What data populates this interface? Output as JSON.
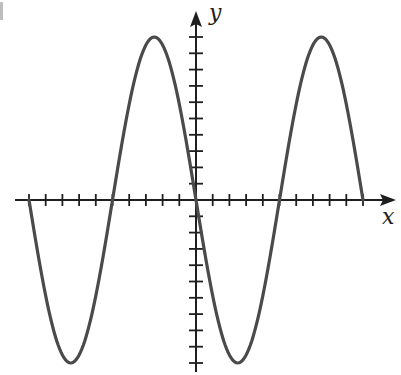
{
  "chart_data": {
    "type": "line",
    "title": "",
    "xlabel": "x",
    "ylabel": "y",
    "xlim": [
      -10,
      11.8
    ],
    "ylim": [
      -10.5,
      11.5
    ],
    "grid": false,
    "legend": null,
    "x_ticks": [
      -10,
      -9,
      -8,
      -7,
      -6,
      -5,
      -4,
      -3,
      -2,
      -1,
      1,
      2,
      3,
      4,
      5,
      6,
      7,
      8,
      9,
      10
    ],
    "y_ticks": [
      -10,
      -9,
      -8,
      -7,
      -6,
      -5,
      -4,
      -3,
      -2,
      -1,
      1,
      2,
      3,
      4,
      5,
      6,
      7,
      8,
      9,
      10
    ],
    "tick_labels_shown": false,
    "function": "y = -10 sin(pi x / 5)",
    "amplitude": 10,
    "period": 10,
    "x": [
      -10,
      -7.5,
      -5,
      -2.5,
      0,
      2.5,
      5,
      7.5,
      10
    ],
    "series": [
      {
        "name": "curve",
        "values": [
          0,
          -10,
          0,
          10,
          0,
          -10,
          0,
          10,
          0
        ]
      }
    ],
    "key_points": {
      "maxima": [
        [
          -2.5,
          10
        ],
        [
          7.5,
          10
        ]
      ],
      "minima": [
        [
          -7.5,
          -10
        ],
        [
          2.5,
          -10
        ]
      ],
      "zeros": [
        -10,
        -5,
        0,
        5,
        10
      ]
    }
  },
  "labels": {
    "x_axis": "x",
    "y_axis": "y"
  },
  "colors": {
    "axis": "#1f1f1f",
    "curve": "#4a4a4a",
    "background": "#ffffff"
  }
}
